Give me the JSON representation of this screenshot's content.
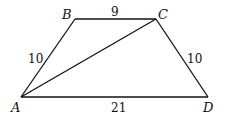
{
  "diagram": {
    "type": "trapezoid",
    "vertices": [
      {
        "id": "A",
        "label": "A",
        "x": 21,
        "y": 97
      },
      {
        "id": "B",
        "label": "B",
        "x": 75,
        "y": 19
      },
      {
        "id": "C",
        "label": "C",
        "x": 156,
        "y": 19
      },
      {
        "id": "D",
        "label": "D",
        "x": 208,
        "y": 97
      }
    ],
    "edges": [
      {
        "from": "A",
        "to": "B",
        "length_label": "10"
      },
      {
        "from": "B",
        "to": "C",
        "length_label": "9"
      },
      {
        "from": "C",
        "to": "D",
        "length_label": "10"
      },
      {
        "from": "A",
        "to": "D",
        "length_label": "21"
      },
      {
        "from": "A",
        "to": "C",
        "length_label": ""
      }
    ],
    "labels": {
      "A": "A",
      "B": "B",
      "C": "C",
      "D": "D",
      "AB": "10",
      "BC": "9",
      "CD": "10",
      "AD": "21"
    },
    "stroke_color": "#111111"
  }
}
